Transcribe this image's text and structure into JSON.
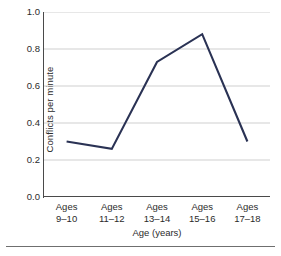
{
  "chart_data": {
    "type": "line",
    "title": "",
    "xlabel": "Age (years)",
    "ylabel": "Conflicts per minute",
    "categories": [
      "Ages 9–10",
      "Ages 11–12",
      "Ages 13–14",
      "Ages 15–16",
      "Ages 17–18"
    ],
    "category_lines": [
      {
        "line1": "Ages",
        "line2": "9–10"
      },
      {
        "line1": "Ages",
        "line2": "11–12"
      },
      {
        "line1": "Ages",
        "line2": "13–14"
      },
      {
        "line1": "Ages",
        "line2": "15–16"
      },
      {
        "line1": "Ages",
        "line2": "17–18"
      }
    ],
    "values": [
      0.3,
      0.26,
      0.73,
      0.88,
      0.3
    ],
    "series": [
      {
        "name": "Conflicts per minute",
        "values": [
          0.3,
          0.26,
          0.73,
          0.88,
          0.3
        ]
      }
    ],
    "ylim": [
      0.0,
      1.0
    ],
    "yticks": [
      0.0,
      0.2,
      0.4,
      0.6,
      0.8,
      1.0
    ],
    "ytick_labels": [
      "0.0",
      "0.2",
      "0.4",
      "0.6",
      "0.8",
      "1.0"
    ],
    "grid": "horizontal",
    "legend": "none",
    "markers": false,
    "line_color": "#2a3254",
    "grid_color": "#c9c9c9",
    "axis_color": "#4a4a4a",
    "background": "#ffffff"
  }
}
